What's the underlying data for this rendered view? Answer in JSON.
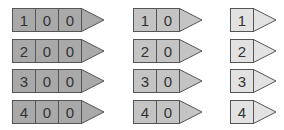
{
  "groups": [
    {
      "name": "three-digit",
      "fill": "#a9a9a9",
      "rows": [
        [
          "1",
          "0",
          "0"
        ],
        [
          "2",
          "0",
          "0"
        ],
        [
          "3",
          "0",
          "0"
        ],
        [
          "4",
          "0",
          "0"
        ]
      ]
    },
    {
      "name": "two-digit",
      "fill": "#c4c4c4",
      "rows": [
        [
          "1",
          "0"
        ],
        [
          "2",
          "0"
        ],
        [
          "3",
          "0"
        ],
        [
          "4",
          "0"
        ]
      ]
    },
    {
      "name": "one-digit",
      "fill": "#e2e2e2",
      "rows": [
        [
          "1"
        ],
        [
          "2"
        ],
        [
          "3"
        ],
        [
          "4"
        ]
      ]
    }
  ]
}
